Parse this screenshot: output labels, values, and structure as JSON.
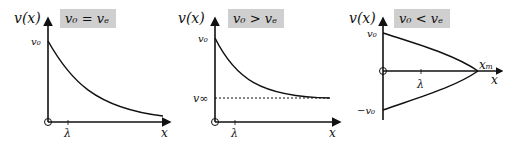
{
  "panels": [
    {
      "condition": "v₀ = vₑ",
      "y_label": "v(x)",
      "x_label": "x",
      "v0_label": "v₀",
      "tick_label": "λ",
      "description": "exponential decay of v(x) from v0 toward 0"
    },
    {
      "condition": "v₀ > vₑ",
      "y_label": "v(x)",
      "x_label": "x",
      "v0_label": "v₀",
      "asymptote_label": "v∞",
      "tick_label": "λ",
      "description": "decay from v0 to asymptote v∞ (dotted line)"
    },
    {
      "condition": "v₀ < vₑ",
      "y_label": "v(x)",
      "x_label": "x",
      "v0_label": "v₀",
      "neg_v0_label": "−v₀",
      "xm_label": "xₘ",
      "tick_label": "λ",
      "description": "v(x) drops from ±v0 to zero at x_m"
    }
  ],
  "colors": {
    "box": "#cfcfcf",
    "line": "#111111"
  }
}
